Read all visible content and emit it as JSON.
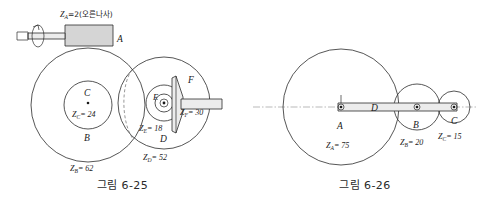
{
  "figures": [
    {
      "id": "fig-6-25",
      "caption": "그림 6-25",
      "type": "worm-gear-train-diagram",
      "parts": [
        {
          "name": "A",
          "label": "A",
          "teeth_text": "Z_A=2(오른나사)",
          "teeth": 2,
          "note": "오른나사",
          "kind": "worm"
        },
        {
          "name": "B",
          "label": "B",
          "teeth_text": "Z_B = 62",
          "teeth": 62,
          "kind": "worm-wheel"
        },
        {
          "name": "C",
          "label": "C",
          "teeth_text": "Z_C = 24",
          "teeth": 24,
          "kind": "spur-gear"
        },
        {
          "name": "D",
          "label": "D",
          "teeth_text": "Z_D = 52",
          "teeth": 52,
          "kind": "spur-gear"
        },
        {
          "name": "E",
          "label": "E",
          "teeth_text": "Z_E = 18",
          "teeth": 18,
          "kind": "spur-gear"
        },
        {
          "name": "F",
          "label": "F",
          "teeth_text": "Z_F = 30",
          "teeth": 30,
          "kind": "bevel-gear"
        }
      ],
      "label_A": "A",
      "label_B": "B",
      "label_C": "C",
      "label_D": "D",
      "label_E": "E",
      "label_F": "F",
      "label_F2": "F",
      "zA_prefix": "Z",
      "zA_sub": "A",
      "zA_value": "=2(오른나사)",
      "zB_sub": "B",
      "zB_value": "= 62",
      "zC_sub": "C",
      "zC_value": "= 24",
      "zD_sub": "D",
      "zD_value": "= 52",
      "zE_sub": "E",
      "zE_value": "= 18",
      "zF_sub": "F",
      "zF_value": "= 30",
      "z_letter": "Z"
    },
    {
      "id": "fig-6-26",
      "caption": "그림 6-26",
      "type": "gear-train-diagram",
      "parts": [
        {
          "name": "A",
          "label": "A",
          "teeth_text": "Z_A = 75",
          "teeth": 75,
          "kind": "gear"
        },
        {
          "name": "B",
          "label": "B",
          "teeth_text": "Z_B = 20",
          "teeth": 20,
          "kind": "gear"
        },
        {
          "name": "C",
          "label": "C",
          "teeth_text": "Z_C = 15",
          "teeth": 15,
          "kind": "gear"
        },
        {
          "name": "D",
          "label": "D",
          "teeth_text": "D",
          "kind": "arm"
        }
      ],
      "label_A": "A",
      "label_B": "B",
      "label_C": "C",
      "label_D": "D",
      "zA_sub": "A",
      "zA_value": "= 75",
      "zB_sub": "B",
      "zB_value": "= 20",
      "zC_sub": "C",
      "zC_value": "= 15",
      "z_letter": "Z"
    }
  ],
  "colors": {
    "line": "#2b2b2b",
    "dashed": "#6b6b6b",
    "axis": "#8a8a8a",
    "fill_gray": "#d5d5d5",
    "fill_light": "#ececec",
    "text": "#1a1a1a",
    "background": "#ffffff"
  }
}
